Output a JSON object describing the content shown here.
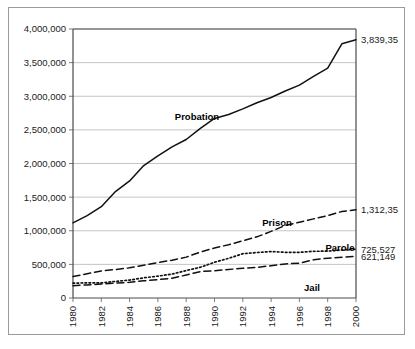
{
  "chart_data": {
    "type": "line",
    "title": "",
    "subtitle": "",
    "xlabel": "",
    "ylabel": "",
    "xlim": [
      1980,
      2000
    ],
    "ylim": [
      0,
      4000000
    ],
    "grid": true,
    "legend_position": "inline-labels",
    "x": [
      1980,
      1981,
      1982,
      1983,
      1984,
      1985,
      1986,
      1987,
      1988,
      1989,
      1990,
      1991,
      1992,
      1993,
      1994,
      1995,
      1996,
      1997,
      1998,
      1999,
      2000
    ],
    "y_ticks": [
      0,
      500000,
      1000000,
      1500000,
      2000000,
      2500000,
      3000000,
      3500000,
      4000000
    ],
    "y_tick_labels": [
      "0",
      "500,000",
      "1,000,000",
      "1,500,000",
      "2,000,000",
      "2,500,000",
      "3,000,000",
      "3,500,000",
      "4,000,000"
    ],
    "x_ticks": [
      1980,
      1982,
      1984,
      1986,
      1988,
      1990,
      1992,
      1994,
      1996,
      1998,
      2000
    ],
    "x_tick_labels": [
      "1980",
      "1982",
      "1984",
      "1986",
      "1988",
      "1990",
      "1992",
      "1994",
      "1996",
      "1998",
      "2000"
    ],
    "series": [
      {
        "name": "Probation",
        "line_style": "solid",
        "label": "Probation",
        "end_value_label": "3,839,35",
        "values": [
          1118097,
          1225934,
          1357264,
          1582947,
          1740948,
          1968712,
          2114621,
          2247158,
          2356483,
          2522125,
          2670234,
          2728472,
          2811611,
          2903061,
          2981022,
          3077861,
          3164996,
          3296513,
          3417613,
          3779922,
          3839352
        ]
      },
      {
        "name": "Prison",
        "line_style": "dashed",
        "label": "Prison",
        "end_value_label": "1,312,35",
        "values": [
          319598,
          360029,
          402914,
          423898,
          448264,
          487593,
          526436,
          562814,
          607766,
          683367,
          743382,
          792535,
          850566,
          909381,
          990147,
          1078542,
          1127528,
          1176564,
          1224469,
          1287172,
          1312354
        ]
      },
      {
        "name": "Parole",
        "line_style": "dotted",
        "label": "Parole",
        "end_value_label": "725,527",
        "values": [
          220438,
          225539,
          224604,
          246440,
          266992,
          300203,
          325638,
          355505,
          407977,
          456803,
          531407,
          590442,
          658601,
          676100,
          690371,
          679421,
          679733,
          694787,
          696385,
          714457,
          725527
        ]
      },
      {
        "name": "Jail",
        "line_style": "dashed",
        "label": "Jail",
        "end_value_label": "621,149",
        "values": [
          182288,
          195085,
          207853,
          221815,
          233018,
          254986,
          272735,
          294092,
          341893,
          393303,
          405320,
          424129,
          441780,
          455500,
          479800,
          507044,
          518492,
          567079,
          592462,
          605943,
          621149
        ]
      }
    ]
  }
}
